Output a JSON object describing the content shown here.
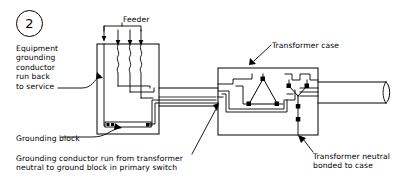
{
  "figure": {
    "number": "2",
    "type": "electrical-wiring-diagram"
  },
  "labels": {
    "equipment_grounding_conductor": "Equipment\ngrounding\nconductor\nrun back\nto service",
    "feeder": "Feeder",
    "transformer_case": "Transformer case",
    "grounding_block": "Grounding block",
    "grounding_conductor_run": "Grounding conductor run from transformer\nneutral to ground block in primary switch",
    "transformer_neutral_bonded": "Transformer neutral\nbonded to case"
  },
  "components": {
    "primary_switch": {
      "name": "primary-switch-enclosure",
      "feeder_conductor_count": 4,
      "fuse_count": 3
    },
    "transformer": {
      "name": "transformer-case",
      "primary_winding": "delta",
      "secondary_winding": "wye"
    },
    "conduit": {
      "name": "conduit-run",
      "segments": 2
    },
    "secondary_cable": {
      "name": "secondary-cable"
    }
  },
  "colors": {
    "line": "#000000",
    "background": "#ffffff",
    "text": "#000000"
  }
}
